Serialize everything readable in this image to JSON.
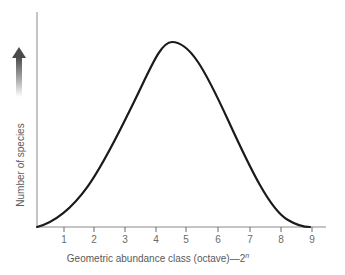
{
  "chart_data": {
    "type": "line",
    "title": "",
    "xlabel": "Geometric abundance class (octave)—2",
    "xlabel_superscript": "n",
    "ylabel": "Number of species",
    "x_ticks": [
      "1",
      "2",
      "3",
      "4",
      "5",
      "6",
      "7",
      "8",
      "9"
    ],
    "xlim": [
      0.1,
      9.5
    ],
    "ylim": [
      0,
      1
    ],
    "grid": false,
    "legend": null,
    "y_axis_indicator": "upward gradient arrow (increasing)",
    "series": [
      {
        "name": "Log-normal species abundance distribution",
        "x": [
          0.1,
          1,
          2,
          3,
          4,
          4.5,
          5,
          6,
          7,
          8,
          9
        ],
        "y": [
          0.0,
          0.1,
          0.3,
          0.62,
          0.93,
          1.0,
          0.96,
          0.7,
          0.33,
          0.08,
          0.0
        ]
      }
    ],
    "peak": {
      "x": 4.5,
      "y": 1.0
    }
  },
  "colors": {
    "curve": "#1a1a1a",
    "axis": "#8a8a8a",
    "text": "#5a5a5a"
  }
}
